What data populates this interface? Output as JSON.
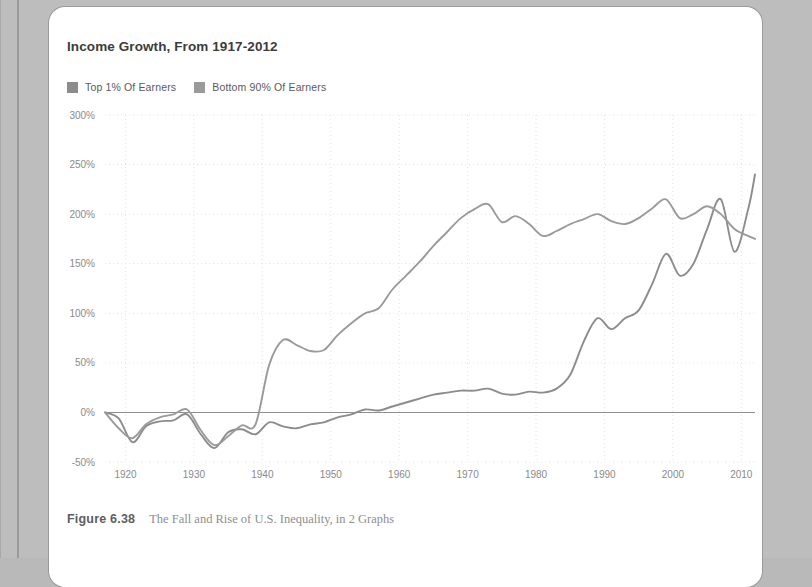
{
  "figure": {
    "number_label": "Figure 6.38",
    "caption": "The Fall and Rise of U.S. Inequality, in 2 Graphs"
  },
  "colors": {
    "top_series": "#8c8c8c",
    "bottom_series": "#9a9a9a",
    "grid": "#e3e3e3",
    "zero_axis": "#8f8f8f",
    "tick_text": "#8a8a8a",
    "title_text": "#3c3c3c",
    "caption_text": "#8e8e8e",
    "card_bg": "#ffffff",
    "page_bg": "#bdbdbd"
  },
  "chart_data": {
    "type": "line",
    "title": "Income Growth, From 1917-2012",
    "xlabel": "",
    "ylabel": "",
    "xlim": [
      1917,
      2012
    ],
    "ylim": [
      -50,
      300
    ],
    "ytick_labels": [
      "300%",
      "250%",
      "200%",
      "150%",
      "100%",
      "50%",
      "0%",
      "-50%"
    ],
    "ytick_values": [
      300,
      250,
      200,
      150,
      100,
      50,
      0,
      -50
    ],
    "xtick_labels": [
      "1920",
      "1930",
      "1940",
      "1950",
      "1960",
      "1970",
      "1980",
      "1990",
      "2000",
      "2010"
    ],
    "xtick_values": [
      1920,
      1930,
      1940,
      1950,
      1960,
      1970,
      1980,
      1990,
      2000,
      2010
    ],
    "grid": true,
    "legend_position": "top-left",
    "unit": "percent",
    "series": [
      {
        "name": "Top 1% Of Earners",
        "color": "#8c8c8c",
        "x": [
          1917,
          1919,
          1921,
          1923,
          1925,
          1927,
          1929,
          1931,
          1933,
          1935,
          1937,
          1939,
          1941,
          1943,
          1945,
          1947,
          1949,
          1951,
          1953,
          1955,
          1957,
          1959,
          1961,
          1963,
          1965,
          1967,
          1969,
          1971,
          1973,
          1975,
          1977,
          1979,
          1981,
          1983,
          1985,
          1987,
          1989,
          1991,
          1993,
          1995,
          1997,
          1999,
          2001,
          2003,
          2005,
          2007,
          2009,
          2011,
          2012
        ],
        "values": [
          0,
          -6,
          -30,
          -14,
          -9,
          -8,
          -2,
          -22,
          -36,
          -20,
          -17,
          -22,
          -10,
          -14,
          -16,
          -12,
          -10,
          -5,
          -2,
          3,
          2,
          6,
          10,
          14,
          18,
          20,
          22,
          22,
          24,
          19,
          18,
          21,
          20,
          24,
          38,
          72,
          95,
          84,
          95,
          103,
          130,
          160,
          138,
          150,
          185,
          215,
          162,
          205,
          240
        ]
      },
      {
        "name": "Bottom 90% Of Earners",
        "color": "#9a9a9a",
        "x": [
          1917,
          1919,
          1921,
          1923,
          1925,
          1927,
          1929,
          1931,
          1933,
          1935,
          1937,
          1939,
          1941,
          1943,
          1945,
          1947,
          1949,
          1951,
          1953,
          1955,
          1957,
          1959,
          1961,
          1963,
          1965,
          1967,
          1969,
          1971,
          1973,
          1975,
          1977,
          1979,
          1981,
          1983,
          1985,
          1987,
          1989,
          1991,
          1993,
          1995,
          1997,
          1999,
          2001,
          2003,
          2005,
          2007,
          2009,
          2011,
          2012
        ],
        "values": [
          0,
          -16,
          -26,
          -12,
          -5,
          -2,
          3,
          -18,
          -33,
          -24,
          -13,
          -12,
          48,
          73,
          68,
          62,
          63,
          78,
          90,
          100,
          105,
          124,
          138,
          152,
          168,
          182,
          196,
          205,
          210,
          192,
          198,
          190,
          178,
          183,
          190,
          195,
          200,
          193,
          190,
          196,
          206,
          215,
          196,
          200,
          208,
          200,
          185,
          178,
          175
        ]
      }
    ]
  },
  "legend": [
    {
      "label": "Top 1% Of Earners",
      "swatch": "#8c8c8c"
    },
    {
      "label": "Bottom 90% Of Earners",
      "swatch": "#9a9a9a"
    }
  ]
}
